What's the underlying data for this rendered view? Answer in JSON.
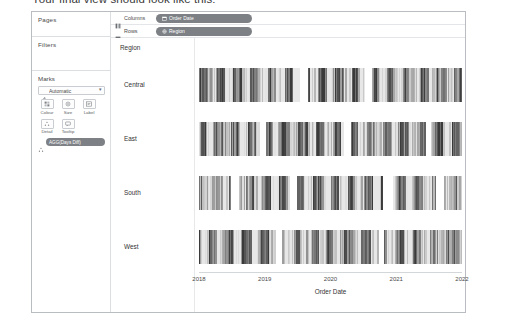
{
  "caption": "Your final view should look like this:",
  "shelves": {
    "pages_label": "Pages",
    "filters_label": "Filters",
    "columns_label": "Columns",
    "rows_label": "Rows",
    "columns_pill": "Order Date",
    "rows_pill": "Region"
  },
  "marks": {
    "title": "Marks",
    "type": "Automatic",
    "buttons": [
      {
        "label": "Colour",
        "icon": "colour-icon"
      },
      {
        "label": "Size",
        "icon": "size-icon"
      },
      {
        "label": "Label",
        "icon": "label-icon"
      },
      {
        "label": "Detail",
        "icon": "detail-icon"
      },
      {
        "label": "Tooltip",
        "icon": "tooltip-icon"
      }
    ],
    "pill": "AGG(Days Diff)"
  },
  "viz": {
    "row_header": "Region",
    "rows": [
      "Central",
      "East",
      "South",
      "West"
    ],
    "axis_title": "Order Date",
    "ticks": [
      "2018",
      "2019",
      "2020",
      "2021",
      "2022"
    ]
  },
  "colors": {
    "pill_bg": "#7d8085",
    "border": "#b9bcc0",
    "text": "#333333",
    "mark_min": "#f2f2f2",
    "mark_max": "#4d4d4d"
  },
  "chart_data": {
    "type": "bar",
    "title": "",
    "xlabel": "Order Date",
    "ylabel": "Region",
    "grid": false,
    "legend": "none",
    "note": "Gantt/dense bar marks: one thin vertical bar per order date, shaded grey by AGG(Days Diff). Four row panels, one per Region.",
    "x": [
      "2018",
      "2019",
      "2020",
      "2021",
      "2022"
    ],
    "xlim": [
      "2018",
      "2022"
    ],
    "categories": [
      "Central",
      "East",
      "South",
      "West"
    ],
    "series": [
      {
        "name": "Central",
        "density": [
          0.95,
          0.72,
          0.88,
          0.4,
          0.93,
          0.66,
          0.81,
          0.55,
          0.9,
          0.35,
          0.87,
          0.74,
          0.6,
          0.96,
          0.48,
          0.83,
          0.7,
          0.92,
          0.38,
          0.86,
          0.64,
          0.79,
          0.5,
          0.94,
          0.42,
          0.89,
          0.68,
          0.76,
          0.58,
          0.91,
          0.33,
          0.85,
          0.62,
          0.97,
          0.45,
          0.8,
          0.71,
          0.54,
          0.88,
          0.39,
          0.93,
          0.67,
          0.82,
          0.51,
          0.9,
          0.36,
          0.84,
          0.73,
          0.59,
          0.95
        ],
        "gaps": [
          0.38,
          0.41,
          0.63,
          0.655
        ]
      },
      {
        "name": "East",
        "density": [
          0.3,
          0.92,
          0.57,
          0.84,
          0.46,
          0.97,
          0.63,
          0.75,
          0.52,
          0.89,
          0.41,
          0.93,
          0.68,
          0.8,
          0.35,
          0.86,
          0.71,
          0.58,
          0.94,
          0.44,
          0.82,
          0.66,
          0.9,
          0.49,
          0.77,
          0.61,
          0.96,
          0.37,
          0.85,
          0.72,
          0.53,
          0.91,
          0.43,
          0.79,
          0.65,
          0.88,
          0.34,
          0.95,
          0.56,
          0.81,
          0.69,
          0.47,
          0.92,
          0.6,
          0.76,
          0.87,
          0.4,
          0.83,
          0.74,
          0.98
        ],
        "gaps": [
          0.23,
          0.255,
          0.55,
          0.575,
          0.86,
          0.88
        ]
      },
      {
        "name": "South",
        "density": [
          0.44,
          0.86,
          0.62,
          0.31,
          0.91,
          0.55,
          0.78,
          0.67,
          0.96,
          0.39,
          0.83,
          0.7,
          0.48,
          0.88,
          0.36,
          0.94,
          0.59,
          0.75,
          0.52,
          0.9,
          0.42,
          0.81,
          0.64,
          0.97,
          0.33,
          0.87,
          0.73,
          0.56,
          0.92,
          0.45,
          0.79,
          0.68,
          0.85,
          0.38,
          0.93,
          0.61,
          0.5,
          0.89,
          0.71,
          0.34,
          0.95,
          0.57,
          0.82,
          0.66,
          0.47,
          0.91,
          0.74,
          0.4,
          0.84,
          0.6
        ],
        "gaps": [
          0.12,
          0.15,
          0.34,
          0.37,
          0.7,
          0.735,
          0.9,
          0.93
        ]
      },
      {
        "name": "West",
        "density": [
          0.88,
          0.54,
          0.93,
          0.41,
          0.79,
          0.66,
          0.97,
          0.36,
          0.85,
          0.72,
          0.49,
          0.91,
          0.58,
          0.83,
          0.64,
          0.95,
          0.38,
          0.77,
          0.69,
          0.52,
          0.9,
          0.45,
          0.86,
          0.61,
          0.98,
          0.33,
          0.8,
          0.73,
          0.56,
          0.92,
          0.43,
          0.84,
          0.67,
          0.51,
          0.94,
          0.39,
          0.78,
          0.7,
          0.87,
          0.48,
          0.96,
          0.59,
          0.82,
          0.65,
          0.35,
          0.89,
          0.75,
          0.53,
          0.93,
          0.62
        ],
        "gaps": [
          0.29,
          0.315,
          0.68,
          0.7
        ]
      }
    ]
  }
}
